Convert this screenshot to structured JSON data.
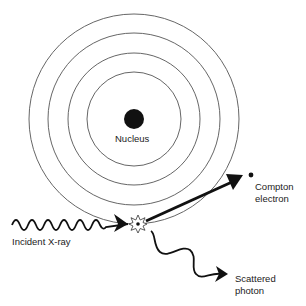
{
  "colors": {
    "background": "#ffffff",
    "line": "#555555",
    "ink": "#111111",
    "text": "#222222"
  },
  "atom": {
    "center": [
      134,
      119
    ],
    "nucleus_radius": 10,
    "shell_radii": [
      47,
      66,
      86,
      105
    ]
  },
  "labels": {
    "nucleus": "Nucleus",
    "incident": "Incident X-ray",
    "compton_line1": "Compton",
    "compton_line2": "electron",
    "scattered_line1": "Scattered",
    "scattered_line2": "photon"
  },
  "icons": {
    "interaction": "starburst-icon",
    "electron": "dot-icon"
  }
}
